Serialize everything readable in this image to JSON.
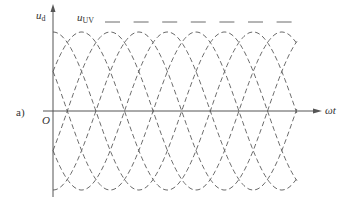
{
  "figure": {
    "panel_label": "a)",
    "y_axis_label": "u",
    "y_axis_sub": "d",
    "x_axis_label": "ωt",
    "origin_label": "O",
    "envelope_label": "u",
    "envelope_sub": "UV"
  },
  "style": {
    "curve_color": "#6a6a6a",
    "axis_color": "#555555",
    "background": "#ffffff"
  },
  "waveform": {
    "type": "six-pulse three-phase line voltages (±u_UV, ±u_VW, ±u_WU)",
    "phase_count": 6,
    "phase_spacing_deg": 60,
    "periods_shown": 1.42,
    "line_style": "dashed"
  }
}
